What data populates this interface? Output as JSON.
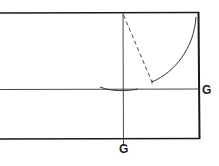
{
  "diagram": {
    "type": "pattern-drafting-construction",
    "labels": {
      "right_point": "G",
      "bottom_point": "G"
    },
    "colors": {
      "line": "#1a1a1a",
      "background": "#ffffff"
    }
  }
}
